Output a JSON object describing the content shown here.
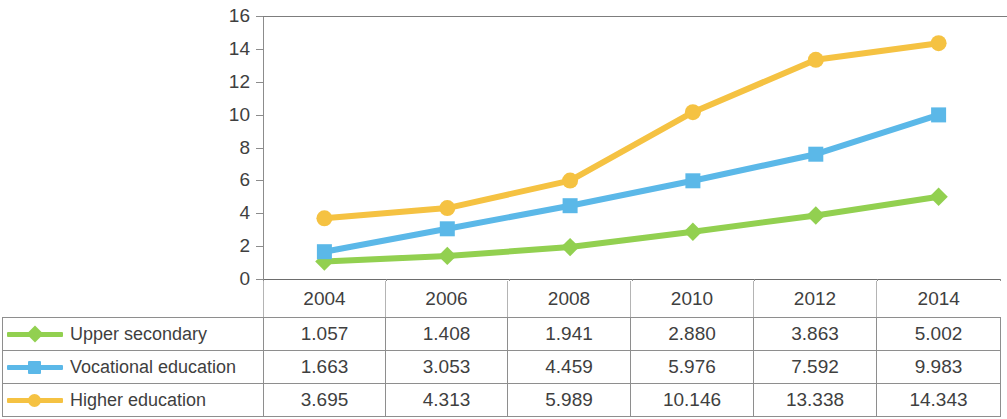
{
  "chart_data": {
    "type": "line",
    "title": "",
    "xlabel": "",
    "ylabel": "",
    "categories": [
      "2004",
      "2006",
      "2008",
      "2010",
      "2012",
      "2014"
    ],
    "ylim": [
      0,
      16
    ],
    "ytick_labels": [
      "16",
      "14",
      "12",
      "10",
      "8",
      "6",
      "4",
      "2",
      "0"
    ],
    "ytick_values": [
      16,
      14,
      12,
      10,
      8,
      6,
      4,
      2,
      0
    ],
    "grid": false,
    "legend_position": "table-left",
    "series": [
      {
        "name": "Upper secondary",
        "color": "#92D050",
        "marker": "diamond",
        "values": [
          1.057,
          1.408,
          1.941,
          2.88,
          3.863,
          5.002
        ],
        "labels": [
          "1.057",
          "1.408",
          "1.941",
          "2.880",
          "3.863",
          "5.002"
        ]
      },
      {
        "name": "Vocational education",
        "color": "#5BB8E8",
        "marker": "square",
        "values": [
          1.663,
          3.053,
          4.459,
          5.976,
          7.592,
          9.983
        ],
        "labels": [
          "1.663",
          "3.053",
          "4.459",
          "5.976",
          "7.592",
          "9.983"
        ]
      },
      {
        "name": "Higher education",
        "color": "#F5C242",
        "marker": "circle",
        "values": [
          3.695,
          4.313,
          5.989,
          10.146,
          13.338,
          14.343
        ],
        "labels": [
          "3.695",
          "4.313",
          "5.989",
          "10.146",
          "13.338",
          "14.343"
        ]
      }
    ]
  },
  "table": {
    "corner_label": "",
    "year_headers": [
      "2004",
      "2006",
      "2008",
      "2010",
      "2012",
      "2014"
    ],
    "rows": [
      {
        "label": "Upper secondary",
        "marker": "diamond-marker-icon",
        "color": "#92D050",
        "cells": [
          "1.057",
          "1.408",
          "1.941",
          "2.880",
          "3.863",
          "5.002"
        ]
      },
      {
        "label": "Vocational education",
        "marker": "square-marker-icon",
        "color": "#5BB8E8",
        "cells": [
          "1.663",
          "3.053",
          "4.459",
          "5.976",
          "7.592",
          "9.983"
        ]
      },
      {
        "label": "Higher education",
        "marker": "circle-marker-icon",
        "color": "#F5C242",
        "cells": [
          "3.695",
          "4.313",
          "5.989",
          "10.146",
          "13.338",
          "14.343"
        ]
      }
    ]
  }
}
